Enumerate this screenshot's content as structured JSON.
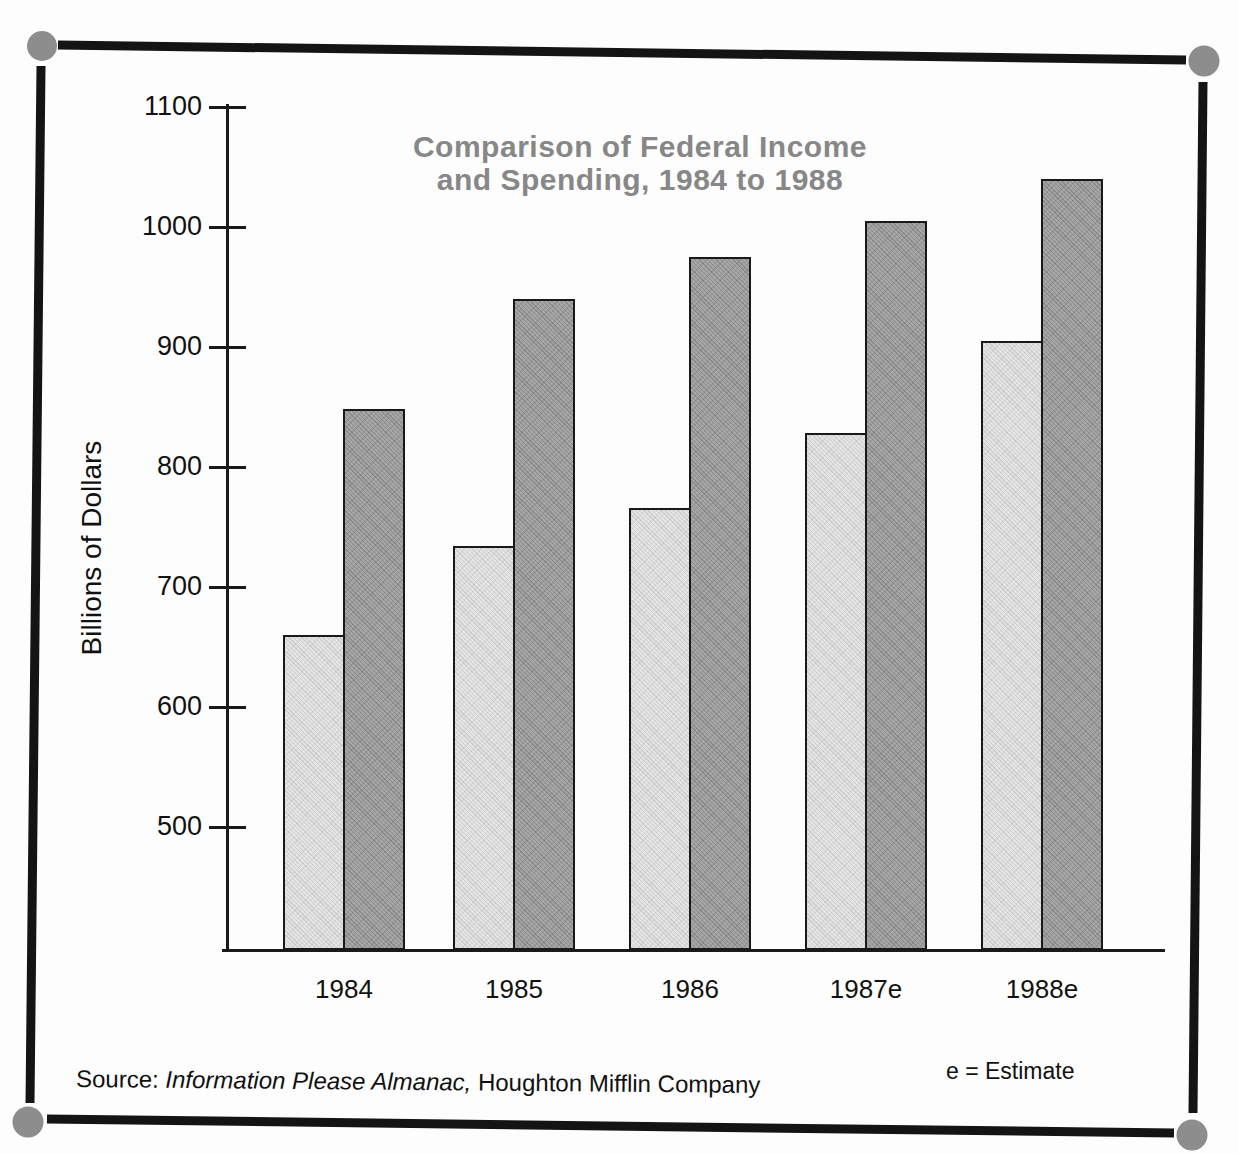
{
  "chart_data": {
    "type": "bar",
    "title_line1": "Comparison of Federal Income",
    "title_line2": "and Spending, 1984 to 1988",
    "ylabel": "Billions of Dollars",
    "categories": [
      "1984",
      "1985",
      "1986",
      "1987e",
      "1988e"
    ],
    "series": [
      {
        "name": "Federal Income",
        "bar_style": "light",
        "color": "#e4e4e4",
        "values": [
          660,
          734,
          766,
          828,
          905
        ]
      },
      {
        "name": "Federal Spending",
        "bar_style": "dark",
        "color": "#a7a7a7",
        "values": [
          848,
          940,
          975,
          1005,
          1040
        ]
      }
    ],
    "ylim": [
      400,
      1100
    ],
    "yticks": [
      1100,
      1000,
      900,
      800,
      700,
      600,
      500
    ],
    "grid": false,
    "legend": "none"
  },
  "source": {
    "prefix": "Source:",
    "italic": "Information Please Almanac,",
    "suffix": "Houghton Mifflin Company"
  },
  "notes": {
    "estimate": "e = Estimate"
  },
  "colors": {
    "title": "#878787",
    "axis": "#1a1a1a",
    "bar_light": "#e4e4e4",
    "bar_dark": "#a7a7a7",
    "frame_line": "#141414",
    "corner_dot": "#8d8d8d"
  }
}
